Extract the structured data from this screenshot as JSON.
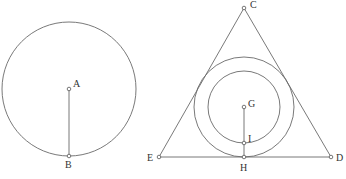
{
  "figures": {
    "left": {
      "circle": {
        "cx": 69,
        "cy": 89,
        "r": 67
      },
      "points": [
        {
          "name": "A",
          "x": 69,
          "y": 89,
          "label": "A",
          "lx": 73,
          "ly": 87
        },
        {
          "name": "B",
          "x": 69,
          "y": 156,
          "label": "B",
          "lx": 65,
          "ly": 168
        }
      ],
      "segments": [
        {
          "from": "A",
          "to": "B"
        }
      ]
    },
    "right": {
      "triangle": {
        "C": [
          244,
          8
        ],
        "D": [
          331,
          157
        ],
        "E": [
          159,
          157
        ]
      },
      "outer_circle": {
        "cx": 244,
        "cy": 107,
        "r": 50
      },
      "inner_circle": {
        "cx": 244,
        "cy": 107,
        "r": 36
      },
      "points": [
        {
          "name": "C",
          "x": 244,
          "y": 8,
          "label": "C",
          "lx": 250,
          "ly": 7
        },
        {
          "name": "D",
          "x": 331,
          "y": 157,
          "label": "D",
          "lx": 336,
          "ly": 161
        },
        {
          "name": "E",
          "x": 159,
          "y": 157,
          "label": "E",
          "lx": 147,
          "ly": 161
        },
        {
          "name": "G",
          "x": 244,
          "y": 107,
          "label": "G",
          "lx": 248,
          "ly": 106
        },
        {
          "name": "I",
          "x": 244,
          "y": 143,
          "label": "I",
          "lx": 248,
          "ly": 141
        },
        {
          "name": "H",
          "x": 244,
          "y": 157,
          "label": "H",
          "lx": 240,
          "ly": 170
        }
      ],
      "segments": [
        {
          "from": "G",
          "to": "H"
        }
      ]
    }
  },
  "labels": {
    "A": "A",
    "B": "B",
    "C": "C",
    "D": "D",
    "E": "E",
    "G": "G",
    "H": "H",
    "I": "I"
  },
  "colors": {
    "stroke": "#6a6a6a",
    "text": "#333333",
    "background": "#ffffff"
  }
}
